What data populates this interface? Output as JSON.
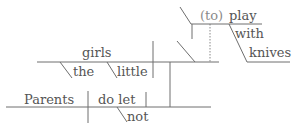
{
  "diagram": {
    "type": "sentence-diagram",
    "sentence": "Parents do not let the little girls play with knives",
    "subject": "Parents",
    "verb": "do let",
    "verb_modifier": "not",
    "object": "girls",
    "object_modifiers": [
      "the",
      "little"
    ],
    "object_complement": {
      "infinitive_marker": "(to)",
      "verb": "play",
      "preposition": "with",
      "prep_object": "knives"
    },
    "colors": {
      "line": "#6e6e6e",
      "text": "#555555",
      "implied_text": "#8a8a8a"
    }
  }
}
